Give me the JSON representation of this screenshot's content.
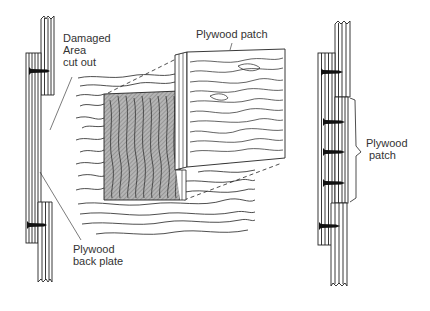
{
  "figure": {
    "colors": {
      "line": "#222222",
      "shade": "#9a9a9a",
      "background": "#ffffff"
    },
    "left_panel": {
      "label_damaged": [
        "Damaged",
        "Area",
        "cut out"
      ],
      "label_back_plate": [
        "Plywood",
        "back plate"
      ],
      "screw_count": 2
    },
    "center_panel": {
      "label_patch": "Plywood patch"
    },
    "right_panel": {
      "label_patch": [
        "Plywood",
        "patch"
      ],
      "screw_count": 5
    }
  }
}
